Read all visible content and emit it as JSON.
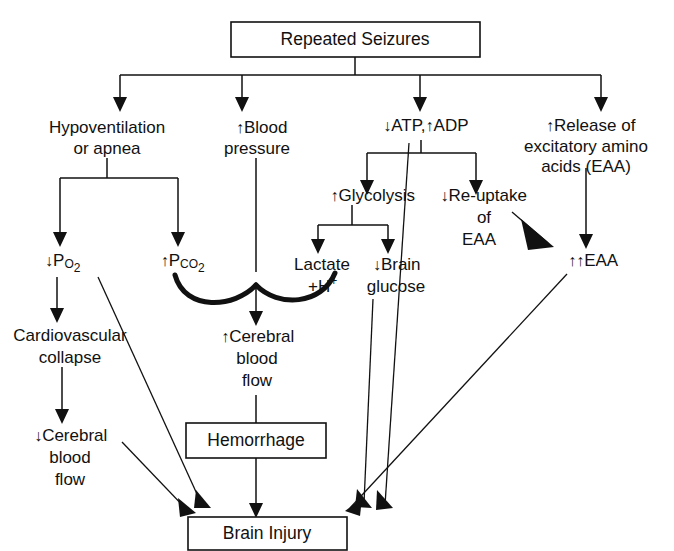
{
  "figure": {
    "title": "Repeated Seizures",
    "type": "flowchart",
    "orientation": "top-down",
    "canvas": {
      "width": 674,
      "height": 551
    },
    "line_color": "#111111",
    "text_color": "#111111",
    "background_color": "#ffffff"
  },
  "nodes": {
    "repeated_seizures": {
      "label": "Repeated Seizures",
      "shape": "box"
    },
    "hypoventilation": {
      "line1": "Hypoventilation",
      "line2": "or apnea",
      "shape": "plain"
    },
    "blood_pressure": {
      "arrow": "↑",
      "line1": "Blood",
      "line2": "pressure",
      "shape": "plain"
    },
    "atp_adp": {
      "arrow1": "↓",
      "text1": "ATP,",
      "arrow2": "↑",
      "text2": "ADP",
      "shape": "plain"
    },
    "release_eaa": {
      "arrow": "↑",
      "line1": "Release of",
      "line2": "excitatory amino",
      "line3": "acids (EAA)",
      "shape": "plain"
    },
    "po2": {
      "arrow": "↓",
      "base": "P",
      "sub": "O",
      "sub2": "2",
      "display": "↓Po2",
      "shape": "plain"
    },
    "pco2": {
      "arrow": "↑",
      "base": "P",
      "sub": "CO",
      "sub2": "2",
      "display": "↑Pco2",
      "shape": "plain"
    },
    "glycolysis": {
      "arrow": "↑",
      "label": "Glycolysis",
      "shape": "plain"
    },
    "reuptake_eaa": {
      "arrow": "↓",
      "line1": "Re-uptake",
      "line2": "of",
      "line3": "EAA",
      "shape": "plain"
    },
    "lactate": {
      "line1": "Lactate",
      "line2": "+H",
      "sup": "+",
      "shape": "plain"
    },
    "brain_glucose": {
      "arrow": "↓",
      "line1": "Brain",
      "line2": "glucose",
      "shape": "plain"
    },
    "eaa_increase": {
      "arrow": "↑↑",
      "label": "EAA",
      "shape": "plain"
    },
    "cardiovascular_collapse": {
      "line1": "Cardiovascular",
      "line2": "collapse",
      "shape": "plain"
    },
    "cerebral_blood_flow_down": {
      "arrow": "↓",
      "line1": "Cerebral",
      "line2": "blood",
      "line3": "flow",
      "shape": "plain"
    },
    "cerebral_blood_flow_up": {
      "arrow": "↑",
      "line1": "Cerebral",
      "line2": "blood",
      "line3": "flow",
      "shape": "plain"
    },
    "hemorrhage": {
      "label": "Hemorrhage",
      "shape": "box"
    },
    "brain_injury": {
      "label": "Brain Injury",
      "shape": "box"
    }
  },
  "edges": [
    {
      "from": "repeated_seizures",
      "to": "hypoventilation"
    },
    {
      "from": "repeated_seizures",
      "to": "blood_pressure"
    },
    {
      "from": "repeated_seizures",
      "to": "atp_adp"
    },
    {
      "from": "repeated_seizures",
      "to": "release_eaa"
    },
    {
      "from": "hypoventilation",
      "to": "po2"
    },
    {
      "from": "hypoventilation",
      "to": "pco2"
    },
    {
      "from": "po2",
      "to": "cardiovascular_collapse"
    },
    {
      "from": "po2",
      "to": "brain_injury"
    },
    {
      "from": "pco2",
      "to": "cerebral_blood_flow_up"
    },
    {
      "from": "blood_pressure",
      "to": "cerebral_blood_flow_up"
    },
    {
      "from": "atp_adp",
      "to": "glycolysis"
    },
    {
      "from": "atp_adp",
      "to": "reuptake_eaa"
    },
    {
      "from": "atp_adp",
      "to": "brain_injury"
    },
    {
      "from": "glycolysis",
      "to": "lactate"
    },
    {
      "from": "glycolysis",
      "to": "brain_glucose"
    },
    {
      "from": "lactate",
      "to": "cerebral_blood_flow_up"
    },
    {
      "from": "brain_glucose",
      "to": "brain_injury"
    },
    {
      "from": "reuptake_eaa",
      "to": "eaa_increase"
    },
    {
      "from": "release_eaa",
      "to": "eaa_increase"
    },
    {
      "from": "eaa_increase",
      "to": "brain_injury"
    },
    {
      "from": "cardiovascular_collapse",
      "to": "cerebral_blood_flow_down"
    },
    {
      "from": "cerebral_blood_flow_down",
      "to": "brain_injury"
    },
    {
      "from": "cerebral_blood_flow_up",
      "to": "hemorrhage"
    },
    {
      "from": "hemorrhage",
      "to": "brain_injury"
    }
  ]
}
